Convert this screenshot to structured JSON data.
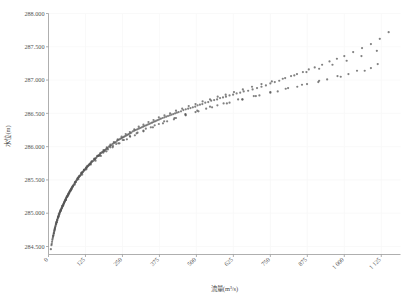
{
  "chart_data": {
    "type": "scatter",
    "title": "",
    "xlabel": "流量(m³/s)",
    "ylabel": "水位(m)",
    "xlim": [
      0,
      1190
    ],
    "ylim": [
      284.38,
      288.0
    ],
    "xticks": [
      0,
      125,
      250,
      375,
      500,
      625,
      750,
      875,
      1000,
      1125
    ],
    "xtick_labels": [
      "0",
      "125",
      "250",
      "375",
      "500",
      "625",
      "750",
      "875",
      "1 000",
      "1 125"
    ],
    "yticks": [
      284.5,
      285.0,
      285.5,
      286.0,
      286.5,
      287.0,
      287.5,
      288.0
    ],
    "ytick_labels": [
      "284.500",
      "285.000",
      "285.500",
      "286.000",
      "286.500",
      "287.000",
      "287.500",
      "288.000"
    ],
    "grid": true,
    "grid_color": "#f7f7f7",
    "legend": "none",
    "marker_color": "#555555",
    "marker_size": 1.1,
    "xtick_label_rotation": -45,
    "series": [
      {
        "name": "水位流量关系点据",
        "x": [
          8,
          10,
          12,
          13,
          15,
          16,
          17,
          18,
          19,
          20,
          21,
          22,
          23,
          24,
          25,
          26,
          27,
          28,
          29,
          30,
          31,
          32,
          33,
          34,
          35,
          36,
          37,
          38,
          39,
          40,
          41,
          42,
          43,
          44,
          45,
          46,
          47,
          48,
          49,
          50,
          51,
          52,
          53,
          54,
          55,
          56,
          57,
          58,
          59,
          60,
          61,
          62,
          63,
          64,
          65,
          66,
          67,
          68,
          69,
          70,
          71,
          72,
          73,
          74,
          75,
          76,
          77,
          78,
          79,
          80,
          82,
          84,
          86,
          88,
          90,
          92,
          94,
          96,
          98,
          100,
          102,
          104,
          106,
          108,
          110,
          112,
          114,
          116,
          118,
          120,
          122,
          124,
          126,
          128,
          130,
          132,
          134,
          136,
          138,
          140,
          143,
          146,
          149,
          152,
          155,
          158,
          161,
          164,
          167,
          170,
          173,
          176,
          179,
          182,
          185,
          188,
          191,
          194,
          197,
          200,
          204,
          208,
          212,
          216,
          220,
          224,
          228,
          232,
          236,
          240,
          244,
          248,
          252,
          256,
          260,
          264,
          268,
          272,
          276,
          280,
          285,
          290,
          295,
          300,
          305,
          310,
          315,
          320,
          325,
          330,
          335,
          340,
          345,
          350,
          355,
          360,
          365,
          370,
          375,
          380,
          386,
          392,
          398,
          404,
          410,
          416,
          422,
          428,
          434,
          440,
          448,
          456,
          464,
          472,
          480,
          488,
          496,
          504,
          512,
          520,
          530,
          540,
          550,
          560,
          570,
          580,
          590,
          600,
          612,
          624,
          636,
          648,
          660,
          675,
          690,
          705,
          720,
          735,
          750,
          765,
          780,
          800,
          820,
          840,
          860,
          880,
          900,
          925,
          950,
          975,
          1000,
          1030,
          1060,
          1090,
          1120,
          1150,
          22,
          29,
          35,
          41,
          47,
          53,
          58,
          64,
          70,
          76,
          83,
          90,
          97,
          104,
          112,
          120,
          128,
          137,
          146,
          155,
          165,
          175,
          186,
          197,
          209,
          221,
          234,
          247,
          261,
          275,
          290,
          305,
          321,
          338,
          355,
          373,
          392,
          411,
          431,
          452,
          474,
          497,
          521,
          546,
          572,
          599,
          627,
          657,
          688,
          720,
          755,
          792,
          831,
          872,
          915,
          960,
          1008,
          1058,
          1110,
          18,
          25,
          32,
          38,
          45,
          52,
          59,
          66,
          74,
          82,
          91,
          100,
          110,
          120,
          131,
          143,
          156,
          170,
          185,
          201,
          218,
          236,
          255,
          276,
          298,
          321,
          346,
          373,
          401,
          431,
          463,
          497,
          533,
          571,
          612,
          655,
          701,
          750,
          802,
          857,
          915,
          977,
          1043,
          1113,
          11,
          16,
          21,
          27,
          33,
          40,
          47,
          55,
          63,
          72,
          81,
          91,
          102,
          114,
          127,
          141,
          156,
          172,
          190,
          209,
          229,
          251,
          275,
          301,
          329,
          359,
          391,
          426,
          463,
          503,
          546,
          592,
          641,
          694,
          750,
          810,
          874,
          942,
          1014,
          1090,
          14,
          20,
          27,
          34,
          42,
          50,
          59,
          68,
          78,
          89,
          101,
          114,
          128,
          143,
          159,
          177,
          196,
          217,
          240,
          265,
          292,
          321,
          353,
          387,
          424,
          464,
          507,
          553,
          603,
          656,
          713,
          775,
          841,
          912,
          988,
          1069
        ],
        "y": [
          284.46,
          284.52,
          284.57,
          284.6,
          284.64,
          284.66,
          284.68,
          284.7,
          284.72,
          284.74,
          284.76,
          284.78,
          284.8,
          284.81,
          284.83,
          284.84,
          284.86,
          284.87,
          284.89,
          284.9,
          284.92,
          284.93,
          284.94,
          284.96,
          284.97,
          284.98,
          284.99,
          285.01,
          285.02,
          285.03,
          285.04,
          285.05,
          285.06,
          285.07,
          285.08,
          285.09,
          285.1,
          285.11,
          285.12,
          285.13,
          285.14,
          285.15,
          285.16,
          285.17,
          285.18,
          285.19,
          285.2,
          285.21,
          285.22,
          285.23,
          285.24,
          285.25,
          285.25,
          285.26,
          285.27,
          285.28,
          285.29,
          285.3,
          285.3,
          285.31,
          285.32,
          285.33,
          285.34,
          285.34,
          285.35,
          285.36,
          285.37,
          285.37,
          285.38,
          285.39,
          285.4,
          285.42,
          285.43,
          285.45,
          285.46,
          285.47,
          285.49,
          285.5,
          285.51,
          285.53,
          285.54,
          285.55,
          285.56,
          285.57,
          285.58,
          285.6,
          285.61,
          285.62,
          285.63,
          285.64,
          285.65,
          285.66,
          285.67,
          285.68,
          285.69,
          285.7,
          285.71,
          285.72,
          285.73,
          285.74,
          285.75,
          285.77,
          285.78,
          285.79,
          285.81,
          285.82,
          285.83,
          285.85,
          285.86,
          285.87,
          285.88,
          285.9,
          285.91,
          285.92,
          285.93,
          285.94,
          285.95,
          285.96,
          285.97,
          285.98,
          286.0,
          286.01,
          286.02,
          286.04,
          286.05,
          286.06,
          286.07,
          286.09,
          286.1,
          286.11,
          286.12,
          286.13,
          286.14,
          286.15,
          286.16,
          286.17,
          286.18,
          286.19,
          286.2,
          286.21,
          286.23,
          286.24,
          286.25,
          286.26,
          286.27,
          286.28,
          286.29,
          286.3,
          286.31,
          286.32,
          286.33,
          286.34,
          286.35,
          286.36,
          286.37,
          286.38,
          286.39,
          286.4,
          286.41,
          286.42,
          286.43,
          286.44,
          286.45,
          286.46,
          286.47,
          286.48,
          286.49,
          286.5,
          286.51,
          286.52,
          286.53,
          286.55,
          286.56,
          286.57,
          286.58,
          286.59,
          286.6,
          286.62,
          286.63,
          286.64,
          286.66,
          286.67,
          286.69,
          286.7,
          286.71,
          286.73,
          286.74,
          286.75,
          286.77,
          286.78,
          286.8,
          286.81,
          286.83,
          286.84,
          286.86,
          286.88,
          286.9,
          286.92,
          286.95,
          286.97,
          286.99,
          287.03,
          287.06,
          287.09,
          287.12,
          287.16,
          287.19,
          287.23,
          287.28,
          287.32,
          287.36,
          287.42,
          287.48,
          287.54,
          287.62,
          287.72,
          284.78,
          284.9,
          284.99,
          285.05,
          285.11,
          285.16,
          285.2,
          285.25,
          285.3,
          285.35,
          285.41,
          285.46,
          285.52,
          285.56,
          285.61,
          285.65,
          285.69,
          285.73,
          285.78,
          285.82,
          285.86,
          285.9,
          285.95,
          285.99,
          286.03,
          286.07,
          286.11,
          286.15,
          286.19,
          286.22,
          286.26,
          286.3,
          286.33,
          286.37,
          286.4,
          286.44,
          286.47,
          286.5,
          286.54,
          286.57,
          286.61,
          286.64,
          286.68,
          286.71,
          286.75,
          286.78,
          286.82,
          286.86,
          286.9,
          286.94,
          286.98,
          287.02,
          287.07,
          287.12,
          287.17,
          287.23,
          287.29,
          287.36,
          287.44,
          284.7,
          284.84,
          284.94,
          285.01,
          285.08,
          285.15,
          285.21,
          285.27,
          285.33,
          285.4,
          285.47,
          285.53,
          285.6,
          285.65,
          285.71,
          285.76,
          285.81,
          285.86,
          285.91,
          285.96,
          286.01,
          286.05,
          286.1,
          286.15,
          286.2,
          286.24,
          286.29,
          286.34,
          286.38,
          286.43,
          286.48,
          286.52,
          286.57,
          286.62,
          286.66,
          286.71,
          286.76,
          286.81,
          286.87,
          286.93,
          286.99,
          287.06,
          287.14,
          287.24,
          284.54,
          284.66,
          284.76,
          284.87,
          284.95,
          285.03,
          285.11,
          285.18,
          285.25,
          285.33,
          285.4,
          285.47,
          285.54,
          285.61,
          285.68,
          285.74,
          285.81,
          285.87,
          285.93,
          285.99,
          286.04,
          286.1,
          286.16,
          286.21,
          286.27,
          286.32,
          286.38,
          286.43,
          286.49,
          286.54,
          286.6,
          286.65,
          286.71,
          286.76,
          286.82,
          286.88,
          286.94,
          287.01,
          287.09,
          287.18,
          284.62,
          284.74,
          284.86,
          284.95,
          285.04,
          285.12,
          285.2,
          285.28,
          285.36,
          285.43,
          285.51,
          285.58,
          285.66,
          285.73,
          285.79,
          285.86,
          285.93,
          285.99,
          286.05,
          286.11,
          286.17,
          286.23,
          286.29,
          286.35,
          286.41,
          286.47,
          286.53,
          286.59,
          286.65,
          286.71,
          286.77,
          286.83,
          286.9,
          286.97,
          287.05,
          287.14
        ]
      }
    ]
  }
}
